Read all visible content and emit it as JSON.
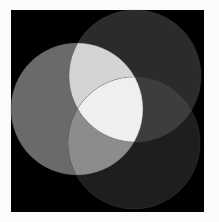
{
  "diagram": {
    "type": "three-circle-venn",
    "canvas": {
      "width": 219,
      "height": 222,
      "background": "#fbfbfb"
    },
    "panel": {
      "x": 11,
      "y": 10,
      "width": 193,
      "height": 202,
      "fill": "#000000"
    },
    "circles": [
      {
        "id": "left",
        "cx": 77,
        "cy": 109,
        "r": 66,
        "fill": "#6a6a6a"
      },
      {
        "id": "top",
        "cx": 135,
        "cy": 76,
        "r": 66,
        "fill": "#2b2b2b"
      },
      {
        "id": "bottom",
        "cx": 134,
        "cy": 143,
        "r": 66,
        "fill": "#1e1e1e"
      }
    ],
    "overlaps": {
      "left_top": {
        "fill": "#d4d4d4"
      },
      "left_bottom": {
        "fill": "#8c8c8c"
      },
      "top_bottom": {
        "fill": "#3d3d3d"
      },
      "left_top_bottom": {
        "fill": "#efefef"
      }
    },
    "edge_stroke": "#555555"
  }
}
